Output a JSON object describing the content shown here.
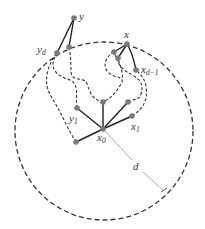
{
  "figure": {
    "type": "ball-path diagram",
    "colors": {
      "node": "#7a7a7a",
      "edge": "#222222",
      "dashed": "#333333",
      "radius_line": "#a8a8a8"
    },
    "labels": {
      "y": {
        "base": "y",
        "sub": ""
      },
      "y_d": {
        "base": "y",
        "sub": "d"
      },
      "x": {
        "base": "x",
        "sub": ""
      },
      "x_d_minus_1": {
        "base": "x",
        "sub": "d−1"
      },
      "y_1": {
        "base": "y",
        "sub": "1"
      },
      "x_1": {
        "base": "x",
        "sub": "1"
      },
      "x_0": {
        "base": "x",
        "sub": "0"
      },
      "d": {
        "base": "d",
        "sub": ""
      }
    }
  }
}
